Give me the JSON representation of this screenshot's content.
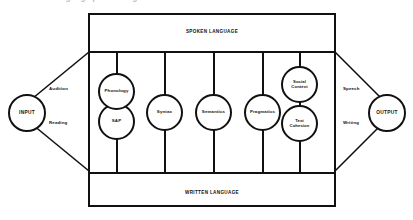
{
  "figure": {
    "top_clipped_caption": "A model of language processing",
    "bands": {
      "spoken": "SPOKEN LANGUAGE",
      "written": "WRITTEN LANGUAGE"
    },
    "io": {
      "input": "INPUT",
      "output": "OUTPUT"
    },
    "paths": {
      "input_upper": "Audition",
      "input_lower": "Reading",
      "output_upper": "Speech",
      "output_lower": "Writing"
    },
    "components": [
      {
        "id": "phonology",
        "label": "Phonology"
      },
      {
        "id": "sap",
        "label": "SAP"
      },
      {
        "id": "syntax",
        "label": "Syntax"
      },
      {
        "id": "semantics",
        "label": "Semantics"
      },
      {
        "id": "pragmatics",
        "label": "Pragmatics"
      },
      {
        "id": "social-context",
        "line1": "Social",
        "line2": "Context"
      },
      {
        "id": "text-cohesion",
        "line1": "Text",
        "line2": "Cohesion"
      }
    ],
    "colors": {
      "stroke": "#111111",
      "background": "#ffffff"
    }
  }
}
